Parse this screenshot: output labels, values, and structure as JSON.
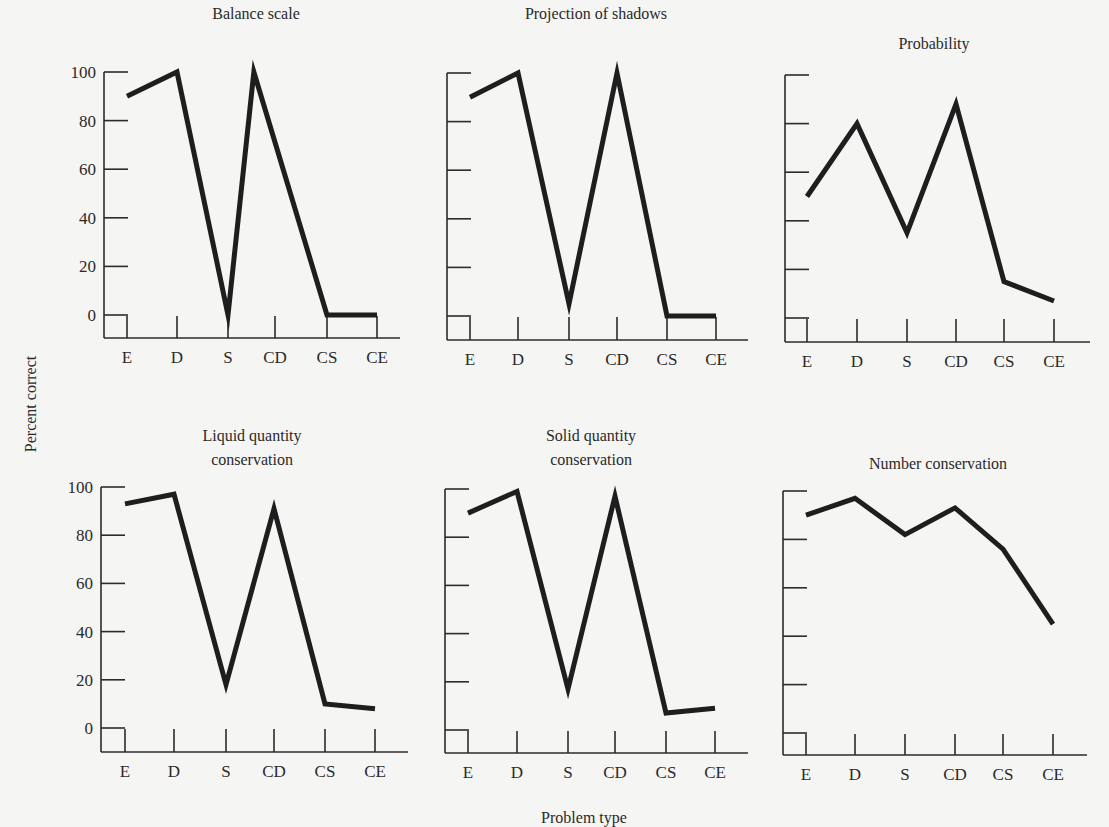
{
  "figure": {
    "y_axis_title": "Percent correct",
    "x_axis_title": "Problem type",
    "colors": {
      "background": "#f5f5f3",
      "line": "#1e1e1e",
      "axis": "#2b2b2b",
      "text": "#2a2a2a"
    }
  },
  "chart_data": [
    {
      "type": "line",
      "title": "Balance scale",
      "categories": [
        "E",
        "D",
        "S",
        "CD",
        "CS",
        "CE"
      ],
      "values": [
        90,
        100,
        0,
        100,
        0,
        0
      ],
      "xlabel": "Problem type",
      "ylabel": "Percent correct",
      "ylim": [
        0,
        100
      ],
      "yticks": [
        0,
        20,
        40,
        60,
        80,
        100
      ],
      "show_ytick_labels": true,
      "grid": false
    },
    {
      "type": "line",
      "title": "Projection of shadows",
      "categories": [
        "E",
        "D",
        "S",
        "CD",
        "CS",
        "CE"
      ],
      "values": [
        90,
        100,
        5,
        100,
        0,
        0
      ],
      "xlabel": "Problem type",
      "ylabel": "Percent correct",
      "ylim": [
        0,
        100
      ],
      "yticks": [
        0,
        20,
        40,
        60,
        80,
        100
      ],
      "show_ytick_labels": false,
      "grid": false
    },
    {
      "type": "line",
      "title": "Probability",
      "categories": [
        "E",
        "D",
        "S",
        "CD",
        "CS",
        "CE"
      ],
      "values": [
        50,
        80,
        35,
        88,
        15,
        7
      ],
      "xlabel": "Problem type",
      "ylabel": "Percent correct",
      "ylim": [
        0,
        100
      ],
      "yticks": [
        0,
        20,
        40,
        60,
        80,
        100
      ],
      "show_ytick_labels": false,
      "grid": false
    },
    {
      "type": "line",
      "title": "Liquid quantity conservation",
      "title_lines": [
        "Liquid quantity",
        "conservation"
      ],
      "categories": [
        "E",
        "D",
        "S",
        "CD",
        "CS",
        "CE"
      ],
      "values": [
        93,
        97,
        18,
        91,
        10,
        8
      ],
      "xlabel": "Problem type",
      "ylabel": "Percent correct",
      "ylim": [
        0,
        100
      ],
      "yticks": [
        0,
        20,
        40,
        60,
        80,
        100
      ],
      "show_ytick_labels": true,
      "grid": false
    },
    {
      "type": "line",
      "title": "Solid quantity conservation",
      "title_lines": [
        "Solid quantity",
        "conservation"
      ],
      "categories": [
        "E",
        "D",
        "S",
        "CD",
        "CS",
        "CE"
      ],
      "values": [
        90,
        99,
        17,
        97,
        7,
        9
      ],
      "xlabel": "Problem type",
      "ylabel": "Percent correct",
      "ylim": [
        0,
        100
      ],
      "yticks": [
        0,
        20,
        40,
        60,
        80,
        100
      ],
      "show_ytick_labels": false,
      "grid": false
    },
    {
      "type": "line",
      "title": "Number conservation",
      "categories": [
        "E",
        "D",
        "S",
        "CD",
        "CS",
        "CE"
      ],
      "values": [
        90,
        97,
        82,
        93,
        76,
        45
      ],
      "xlabel": "Problem type",
      "ylabel": "Percent correct",
      "ylim": [
        0,
        100
      ],
      "yticks": [
        0,
        20,
        40,
        60,
        80,
        100
      ],
      "show_ytick_labels": false,
      "grid": false
    }
  ]
}
